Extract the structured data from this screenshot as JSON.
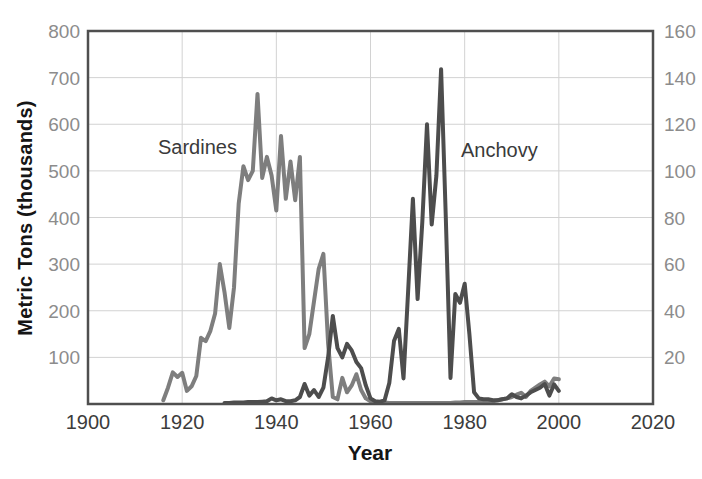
{
  "figure_title": "",
  "labels": {
    "sardines": "Sardines",
    "anchovy": "Anchovy"
  },
  "colors": {
    "sardine_line": "#7e7e7e",
    "anchovy_line": "#4d4d4d",
    "grid": "#d2d2d2",
    "frame": "#4f4f4f",
    "tick_label_gray": "#8c8c8c",
    "x_tick_label": "#3c3c3c",
    "axis_title_black": "#151515"
  },
  "chart_data": {
    "type": "line",
    "title": "",
    "xlabel": "Year",
    "ylabel": "Metric Tons (thousands)",
    "xlim": [
      1900,
      2020
    ],
    "ylim_left": [
      0,
      800
    ],
    "ylim_right": [
      0,
      160
    ],
    "x_ticks": [
      1900,
      1920,
      1940,
      1960,
      1980,
      2000,
      2020
    ],
    "y_left_ticks": [
      800,
      700,
      600,
      500,
      400,
      300,
      200,
      100
    ],
    "y_right_ticks": [
      160,
      140,
      120,
      100,
      80,
      60,
      40,
      20
    ],
    "grid": true,
    "legend_position": "in-plot-text-labels",
    "series": [
      {
        "name": "Sardines",
        "axis": "left",
        "color": "#7e7e7e",
        "x": [
          1916,
          1917,
          1918,
          1919,
          1920,
          1921,
          1922,
          1923,
          1924,
          1925,
          1926,
          1927,
          1928,
          1929,
          1930,
          1931,
          1932,
          1933,
          1934,
          1935,
          1936,
          1937,
          1938,
          1939,
          1940,
          1941,
          1942,
          1943,
          1944,
          1945,
          1946,
          1947,
          1948,
          1949,
          1950,
          1951,
          1952,
          1953,
          1954,
          1955,
          1956,
          1957,
          1958,
          1959,
          1960,
          1961,
          1962,
          1963,
          1964,
          1965,
          1966,
          1967,
          1968,
          1969,
          1970,
          1971,
          1972,
          1973,
          1974,
          1975,
          1976,
          1977,
          1978,
          1979,
          1980,
          1981,
          1982,
          1983,
          1984,
          1985,
          1986,
          1987,
          1988,
          1989,
          1990,
          1991,
          1992,
          1993,
          1994,
          1995,
          1996,
          1997,
          1998,
          1999,
          2000
        ],
        "values": [
          8,
          35,
          68,
          58,
          67,
          28,
          38,
          60,
          142,
          135,
          157,
          194,
          300,
          240,
          163,
          250,
          430,
          510,
          480,
          500,
          665,
          485,
          530,
          490,
          415,
          575,
          440,
          520,
          437,
          530,
          120,
          150,
          220,
          290,
          322,
          130,
          15,
          10,
          56,
          25,
          40,
          64,
          30,
          12,
          6,
          4,
          3,
          3,
          2,
          2,
          2,
          2,
          2,
          2,
          2,
          2,
          2,
          2,
          2,
          2,
          2,
          2,
          3,
          3,
          4,
          4,
          4,
          4,
          5,
          5,
          6,
          8,
          10,
          12,
          15,
          20,
          24,
          15,
          28,
          35,
          42,
          48,
          38,
          55,
          53
        ]
      },
      {
        "name": "Anchovy",
        "axis": "left",
        "color": "#4d4d4d",
        "x": [
          1929,
          1930,
          1931,
          1932,
          1933,
          1934,
          1935,
          1936,
          1937,
          1938,
          1939,
          1940,
          1941,
          1942,
          1943,
          1944,
          1945,
          1946,
          1947,
          1948,
          1949,
          1950,
          1951,
          1952,
          1953,
          1954,
          1955,
          1956,
          1957,
          1958,
          1959,
          1960,
          1961,
          1962,
          1963,
          1964,
          1965,
          1966,
          1967,
          1968,
          1969,
          1970,
          1971,
          1972,
          1973,
          1974,
          1975,
          1976,
          1977,
          1978,
          1979,
          1980,
          1981,
          1982,
          1983,
          1984,
          1985,
          1986,
          1987,
          1988,
          1989,
          1990,
          1991,
          1992,
          1993,
          1994,
          1995,
          1996,
          1997,
          1998,
          1999,
          2000
        ],
        "values": [
          2,
          2,
          3,
          3,
          3,
          4,
          4,
          4,
          5,
          6,
          12,
          8,
          10,
          6,
          6,
          8,
          15,
          43,
          18,
          30,
          15,
          35,
          100,
          189,
          120,
          100,
          129,
          115,
          90,
          77,
          40,
          12,
          6,
          5,
          8,
          45,
          135,
          161,
          55,
          245,
          440,
          225,
          390,
          600,
          385,
          490,
          718,
          400,
          56,
          236,
          217,
          258,
          150,
          25,
          12,
          10,
          10,
          8,
          8,
          10,
          12,
          21,
          15,
          12,
          18,
          25,
          30,
          35,
          43,
          18,
          42,
          28
        ]
      }
    ]
  }
}
